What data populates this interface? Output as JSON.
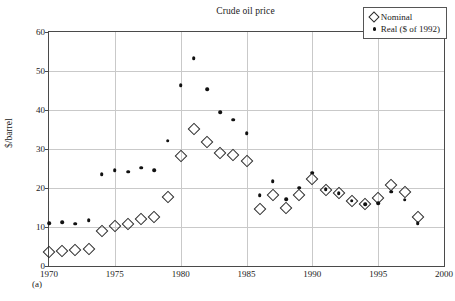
{
  "figure": {
    "caption": "(a)"
  },
  "legend": {
    "position": "top-right",
    "entries": [
      {
        "marker": "open-diamond",
        "label": "Nominal"
      },
      {
        "marker": "filled-circle",
        "label": "Real ($ of 1992)"
      }
    ]
  },
  "chart_data": {
    "type": "scatter",
    "title": "Crude oil price",
    "xlabel": "",
    "ylabel": "$/barrel",
    "xlim": [
      1970,
      2000
    ],
    "ylim": [
      0,
      60
    ],
    "xticks": [
      1970,
      1975,
      1980,
      1985,
      1990,
      1995,
      2000
    ],
    "yticks": [
      0,
      10,
      20,
      30,
      40,
      50,
      60
    ],
    "grid": true,
    "x": [
      1970,
      1971,
      1972,
      1973,
      1974,
      1975,
      1976,
      1977,
      1978,
      1979,
      1980,
      1981,
      1982,
      1983,
      1984,
      1985,
      1986,
      1987,
      1988,
      1989,
      1990,
      1991,
      1992,
      1993,
      1994,
      1995,
      1996,
      1997,
      1998
    ],
    "series": [
      {
        "name": "Nominal",
        "marker": "open-diamond",
        "color": "#2b2b2b",
        "values": [
          3.6,
          3.9,
          4.0,
          4.4,
          9.1,
          10.3,
          10.7,
          12.1,
          12.6,
          17.8,
          28.1,
          35.1,
          31.9,
          29.0,
          28.5,
          26.8,
          14.7,
          18.2,
          14.9,
          18.1,
          22.2,
          19.6,
          18.6,
          16.7,
          15.8,
          17.5,
          20.7,
          19.1,
          12.6
        ]
      },
      {
        "name": "Real ($ of 1992)",
        "marker": "filled-circle",
        "color": "#111111",
        "values": [
          11.0,
          11.3,
          10.8,
          11.8,
          23.5,
          24.5,
          24.2,
          25.2,
          24.6,
          32.1,
          46.4,
          53.3,
          45.4,
          39.5,
          37.5,
          34.1,
          18.2,
          21.7,
          17.2,
          20.1,
          23.9,
          19.7,
          18.6,
          16.7,
          15.8,
          16.1,
          19.1,
          17.0,
          11.0
        ]
      }
    ]
  }
}
